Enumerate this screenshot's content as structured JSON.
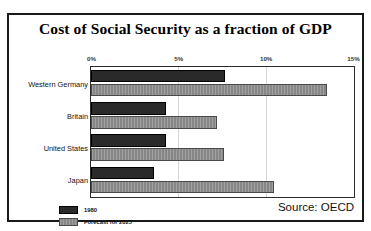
{
  "chart_data": {
    "type": "bar",
    "orientation": "horizontal",
    "title": "Cost of Social Security as a fraction of GDP",
    "xlabel": "",
    "ylabel": "",
    "xlim": [
      0,
      15
    ],
    "xticks": [
      0,
      5,
      10,
      15
    ],
    "xtick_labels": [
      "0%",
      "5%",
      "10%",
      "15%"
    ],
    "grid": false,
    "legend_position": "bottom-left",
    "categories": [
      "Western Germany",
      "Britain",
      "United States",
      "Japan"
    ],
    "series": [
      {
        "name": "1980",
        "color": "#2a2a2a",
        "values": [
          7.7,
          4.3,
          4.3,
          3.6
        ]
      },
      {
        "name": "Forecast for 2025",
        "color": "#8e8e8e",
        "values": [
          13.5,
          7.2,
          7.6,
          10.5
        ]
      }
    ],
    "annotations": {
      "source": "Source: OECD"
    }
  },
  "legend": {
    "items": [
      {
        "label": "1980"
      },
      {
        "label": "Forecast for 2025"
      }
    ]
  },
  "colors": {
    "series_1980": "#2a2a2a",
    "series_2025": "#8e8e8e",
    "frame": "#1a1a1a",
    "text": "#111111"
  }
}
